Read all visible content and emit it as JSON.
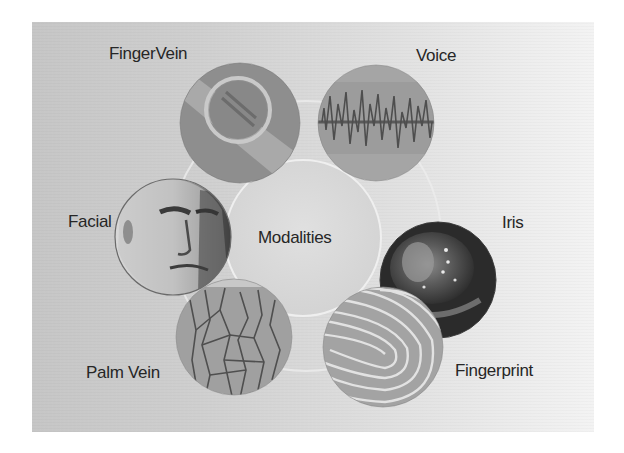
{
  "diagram": {
    "center": {
      "label": "Modalities",
      "cx": 303,
      "cy": 238,
      "r": 78
    },
    "modalities": [
      {
        "id": "finger-vein",
        "label": "FingerVein",
        "cx": 240,
        "cy": 123,
        "r": 60,
        "label_x": 109,
        "label_y": 44
      },
      {
        "id": "voice",
        "label": "Voice",
        "cx": 376,
        "cy": 123,
        "r": 58,
        "label_x": 416,
        "label_y": 46
      },
      {
        "id": "iris",
        "label": "Iris",
        "cx": 438,
        "cy": 280,
        "r": 58,
        "label_x": 502,
        "label_y": 213
      },
      {
        "id": "fingerprint",
        "label": "Fingerprint",
        "cx": 383,
        "cy": 347,
        "r": 60,
        "label_x": 455,
        "label_y": 361
      },
      {
        "id": "palm-vein",
        "label": "Palm Vein",
        "cx": 234,
        "cy": 337,
        "r": 58,
        "label_x": 86,
        "label_y": 363
      },
      {
        "id": "facial",
        "label": "Facial",
        "cx": 173,
        "cy": 237,
        "r": 58,
        "label_x": 68,
        "label_y": 212
      }
    ]
  },
  "colors": {
    "label_text": "#262626",
    "panel_left": "#c6c6c6",
    "panel_right": "#f3f3f3",
    "center_fill": "#d9d9d9",
    "ring": "#eeeeee"
  }
}
